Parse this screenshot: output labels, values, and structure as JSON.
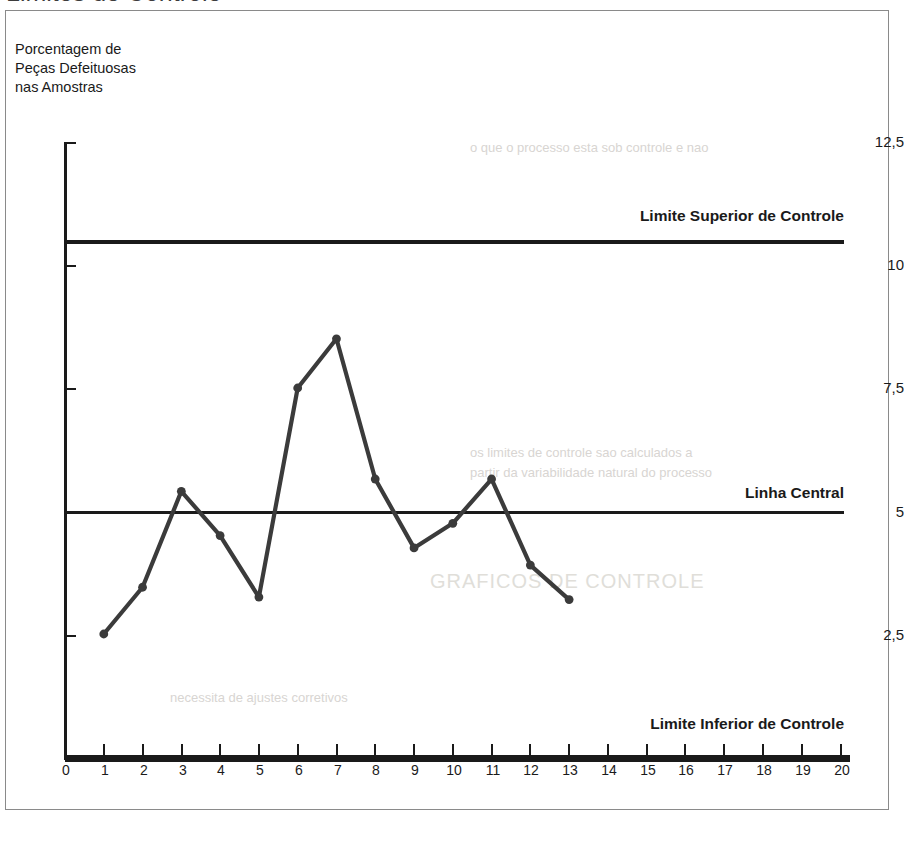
{
  "page": {
    "cutoff_heading": "Limites de Controle"
  },
  "axis_title": {
    "text": "Porcentagem de\nPeças Defeituosas\nnas Amostras"
  },
  "chart_data": {
    "type": "line",
    "title": "",
    "subtitle": "",
    "xlabel": "",
    "ylabel": "Porcentagem de Peças Defeituosas nas Amostras",
    "x": [
      1,
      2,
      3,
      4,
      5,
      6,
      7,
      8,
      9,
      10,
      11,
      12,
      13
    ],
    "values": [
      2.5,
      3.45,
      5.4,
      4.5,
      3.25,
      7.5,
      8.5,
      5.65,
      4.25,
      4.75,
      5.65,
      3.9,
      3.2
    ],
    "series": [
      {
        "name": "Porcentagem de Peças Defeituosas nas Amostras",
        "values": [
          2.5,
          3.45,
          5.4,
          4.5,
          3.25,
          7.5,
          8.5,
          5.65,
          4.25,
          4.75,
          5.65,
          3.9,
          3.2
        ]
      }
    ],
    "xlim": [
      0,
      20
    ],
    "ylim": [
      0,
      12.5
    ],
    "x_ticks": [
      0,
      1,
      2,
      3,
      4,
      5,
      6,
      7,
      8,
      9,
      10,
      11,
      12,
      13,
      14,
      15,
      16,
      17,
      18,
      19,
      20
    ],
    "x_tick_labels": [
      "0",
      "1",
      "2",
      "3",
      "4",
      "5",
      "6",
      "7",
      "8",
      "9",
      "10",
      "11",
      "12",
      "13",
      "14",
      "15",
      "16",
      "17",
      "18",
      "19",
      "20"
    ],
    "y_ticks": [
      2.5,
      5,
      7.5,
      10,
      12.5
    ],
    "y_tick_labels": [
      "2,5",
      "5",
      "7,5",
      "10",
      "12,5"
    ],
    "grid": false,
    "legend_position": "none",
    "reference_lines": [
      {
        "id": "ucl",
        "label": "Limite Superior de Controle",
        "value": 10.5
      },
      {
        "id": "cl",
        "label": "Linha Central",
        "value": 5.0
      },
      {
        "id": "lcl",
        "label": "Limite Inferior de Controle",
        "value": 0.0
      }
    ],
    "series_color": "#3b3b3b",
    "line_color": "#1a1a1a"
  },
  "ghost_text": {
    "lines": [
      "o que o processo esta sob controle e nao",
      "necessita de ajustes corretivos",
      "GRAFICOS DE CONTROLE",
      "os limites de controle sao calculados a",
      "partir da variabilidade natural do processo"
    ]
  }
}
